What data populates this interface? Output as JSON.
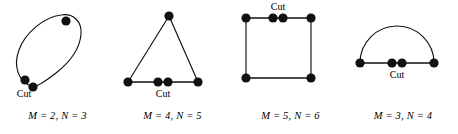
{
  "figure": {
    "background_color": "#ffffff",
    "ink_color": "#111111",
    "cut_label": "Cut",
    "panels": [
      {
        "id": "blob",
        "shape_name": "closed-loop",
        "caption": "M = 2, N = 3",
        "M": 2,
        "N": 3,
        "dot_count": 3,
        "cut_label": "Cut",
        "cut_label_position": "below-left",
        "dots": [
          {
            "name": "dot-upper-right",
            "x": 66,
            "y": 21
          },
          {
            "name": "dot-lower-left-a",
            "x": 25,
            "y": 80
          },
          {
            "name": "dot-lower-left-b",
            "x": 33,
            "y": 87
          }
        ]
      },
      {
        "id": "triangle",
        "shape_name": "triangle",
        "caption": "M = 4, N = 5",
        "M": 4,
        "N": 5,
        "dot_count": 5,
        "cut_label": "Cut",
        "cut_label_position": "below-center",
        "dots": [
          {
            "name": "dot-apex",
            "x": 54,
            "y": 16
          },
          {
            "name": "dot-base-left",
            "x": 13,
            "y": 82
          },
          {
            "name": "dot-base-mid-a",
            "x": 43,
            "y": 82
          },
          {
            "name": "dot-base-mid-b",
            "x": 53,
            "y": 82
          },
          {
            "name": "dot-base-right",
            "x": 83,
            "y": 82
          }
        ]
      },
      {
        "id": "square",
        "shape_name": "square",
        "caption": "M = 5, N = 6",
        "M": 5,
        "N": 6,
        "dot_count": 6,
        "cut_label": "Cut",
        "cut_label_position": "above-center",
        "dots": [
          {
            "name": "dot-top-left",
            "x": 13,
            "y": 18
          },
          {
            "name": "dot-top-mid-a",
            "x": 40,
            "y": 18
          },
          {
            "name": "dot-top-mid-b",
            "x": 50,
            "y": 18
          },
          {
            "name": "dot-top-right",
            "x": 78,
            "y": 18
          },
          {
            "name": "dot-bottom-left",
            "x": 13,
            "y": 78
          },
          {
            "name": "dot-bottom-right",
            "x": 78,
            "y": 78
          }
        ]
      },
      {
        "id": "semicircle",
        "shape_name": "semicircle",
        "caption": "M = 3, N = 4",
        "M": 3,
        "N": 4,
        "dot_count": 4,
        "cut_label": "Cut",
        "cut_label_position": "below-center",
        "dots": [
          {
            "name": "dot-left-end",
            "x": 12,
            "y": 63
          },
          {
            "name": "dot-mid-a",
            "x": 44,
            "y": 63
          },
          {
            "name": "dot-mid-b",
            "x": 54,
            "y": 63
          },
          {
            "name": "dot-right-end",
            "x": 86,
            "y": 63
          }
        ]
      }
    ]
  }
}
